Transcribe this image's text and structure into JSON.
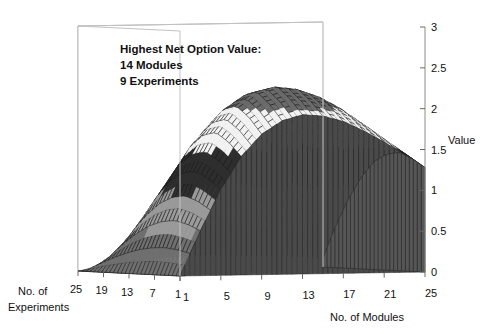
{
  "annotation": {
    "line1": "Highest Net Option Value:",
    "line2": "14 Modules",
    "line3": "9 Experiments"
  },
  "axes": {
    "value_title": "Value",
    "modules_title_line1": "No. of",
    "modules_title": "No. of Modules",
    "experiments_title_line1": "No. of",
    "experiments_title_line2": "Experiments"
  },
  "chart_data": {
    "type": "surface",
    "title": "",
    "xlabel": "No. of Modules",
    "ylabel": "No. of Experiments",
    "zlabel": "Value",
    "x_ticks": [
      "1",
      "5",
      "9",
      "13",
      "17",
      "21",
      "25"
    ],
    "y_ticks": [
      "25",
      "19",
      "13",
      "7",
      "1"
    ],
    "z_ticks": [
      "0",
      "0.5",
      "1",
      "1.5",
      "2",
      "2.5",
      "3"
    ],
    "xlim": [
      1,
      25
    ],
    "ylim": [
      1,
      25
    ],
    "zlim": [
      0,
      3
    ],
    "grid": false,
    "legend": "none",
    "peak": {
      "modules": 14,
      "experiments": 9,
      "value": 2.3
    },
    "contour_bands": [
      {
        "range": [
          0.0,
          0.5
        ],
        "shade": "#6f6f6f"
      },
      {
        "range": [
          0.5,
          1.0
        ],
        "shade": "#9a9a9a"
      },
      {
        "range": [
          1.0,
          1.5
        ],
        "shade": "#2e2e2e"
      },
      {
        "range": [
          1.5,
          2.0
        ],
        "shade": "#f2f2f2"
      },
      {
        "range": [
          2.0,
          2.5
        ],
        "shade": "#6a6a6a"
      }
    ],
    "x": [
      1,
      3,
      5,
      7,
      9,
      11,
      13,
      15,
      17,
      19,
      21,
      23,
      25
    ],
    "y": [
      1,
      4,
      7,
      10,
      13,
      16,
      19,
      22,
      25
    ],
    "z": [
      [
        0.0,
        0.55,
        1.05,
        1.45,
        1.72,
        1.88,
        1.95,
        1.93,
        1.86,
        1.74,
        1.6,
        1.44,
        1.28
      ],
      [
        0.0,
        0.62,
        1.18,
        1.62,
        1.92,
        2.08,
        2.14,
        2.11,
        2.03,
        1.9,
        1.74,
        1.56,
        1.38
      ],
      [
        0.0,
        0.66,
        1.26,
        1.73,
        2.05,
        2.22,
        2.28,
        2.25,
        2.16,
        2.02,
        1.84,
        1.65,
        1.45
      ],
      [
        0.0,
        0.64,
        1.23,
        1.69,
        2.0,
        2.17,
        2.23,
        2.2,
        2.11,
        1.97,
        1.8,
        1.61,
        1.42
      ],
      [
        0.0,
        0.58,
        1.12,
        1.54,
        1.83,
        1.99,
        2.05,
        2.02,
        1.94,
        1.82,
        1.66,
        1.49,
        1.32
      ],
      [
        0.0,
        0.48,
        0.93,
        1.29,
        1.54,
        1.68,
        1.73,
        1.71,
        1.64,
        1.54,
        1.41,
        1.27,
        1.12
      ],
      [
        0.0,
        0.35,
        0.69,
        0.96,
        1.15,
        1.26,
        1.3,
        1.29,
        1.24,
        1.16,
        1.07,
        0.96,
        0.85
      ],
      [
        0.0,
        0.2,
        0.4,
        0.56,
        0.68,
        0.75,
        0.77,
        0.77,
        0.74,
        0.7,
        0.64,
        0.58,
        0.51
      ],
      [
        0.0,
        0.04,
        0.08,
        0.12,
        0.14,
        0.16,
        0.17,
        0.17,
        0.16,
        0.15,
        0.14,
        0.13,
        0.11
      ]
    ]
  }
}
